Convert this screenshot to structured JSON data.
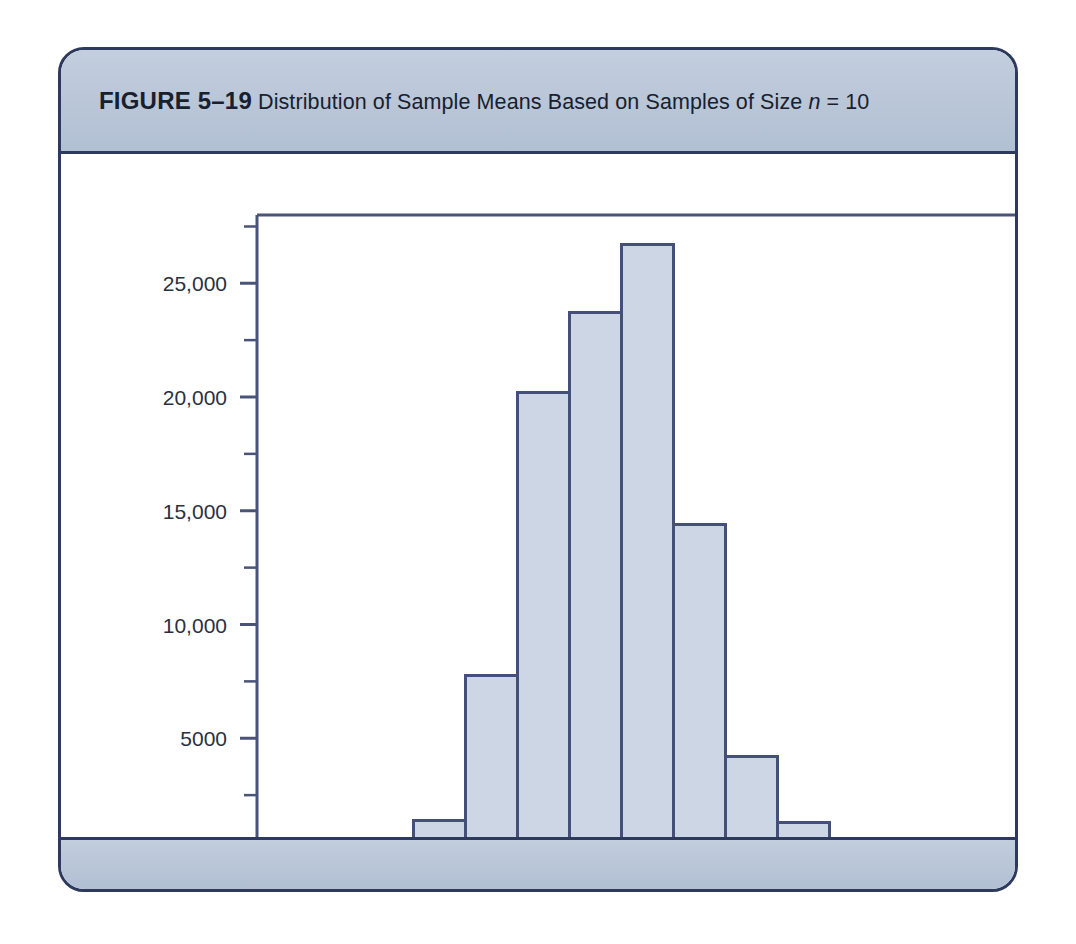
{
  "figure": {
    "label": "FIGURE 5–19",
    "caption": "Distribution of Sample Means Based on Samples of Size",
    "caption_var": "n",
    "caption_tail": "= 10"
  },
  "colors": {
    "card_border": "#2d3a5e",
    "band_fill": "#bcc9da",
    "bar_fill": "#ccd6e4",
    "bar_stroke": "#44507a",
    "axis": "#4a5478",
    "text": "#2b3040"
  },
  "chart_data": {
    "type": "bar",
    "title": "Distribution of Sample Means Based on Samples of Size n = 10",
    "xlabel": "",
    "ylabel": "",
    "bin_width": 0.5,
    "xlim": [
      2.5,
      9.5
    ],
    "ylim": [
      0,
      28000
    ],
    "grid": false,
    "legend": null,
    "xticks": [
      3.0,
      4.0,
      5.0,
      6.0,
      7.0,
      8.0,
      9.0
    ],
    "xtick_labels": [
      "3.0",
      "4.0",
      "5.0",
      "6.0",
      "7.0",
      "8.0",
      "9.0"
    ],
    "x_minor_step": 0.25,
    "yticks": [
      0,
      5000,
      10000,
      15000,
      20000,
      25000
    ],
    "ytick_labels": [
      "0",
      "5000",
      "10,000",
      "15,000",
      "20,000",
      "25,000"
    ],
    "y_minor_step": 2500,
    "bins": [
      {
        "left": 3.5,
        "right": 4.0,
        "center": 3.75,
        "value": 250
      },
      {
        "left": 4.0,
        "right": 4.5,
        "center": 4.25,
        "value": 1400
      },
      {
        "left": 4.5,
        "right": 5.0,
        "center": 4.75,
        "value": 7750
      },
      {
        "left": 5.0,
        "right": 5.5,
        "center": 5.25,
        "value": 20200
      },
      {
        "left": 5.5,
        "right": 6.0,
        "center": 5.75,
        "value": 23700
      },
      {
        "left": 6.0,
        "right": 6.5,
        "center": 6.25,
        "value": 26700
      },
      {
        "left": 6.5,
        "right": 7.0,
        "center": 6.75,
        "value": 14400
      },
      {
        "left": 7.0,
        "right": 7.5,
        "center": 7.25,
        "value": 4200
      },
      {
        "left": 7.5,
        "right": 8.0,
        "center": 7.75,
        "value": 1300
      },
      {
        "left": 8.0,
        "right": 8.5,
        "center": 8.25,
        "value": 350
      }
    ],
    "categories": [
      "3.5-4.0",
      "4.0-4.5",
      "4.5-5.0",
      "5.0-5.5",
      "5.5-6.0",
      "6.0-6.5",
      "6.5-7.0",
      "7.0-7.5",
      "7.5-8.0",
      "8.0-8.5"
    ],
    "values": [
      250,
      1400,
      7750,
      20200,
      23700,
      26700,
      14400,
      4200,
      1300,
      350
    ]
  }
}
